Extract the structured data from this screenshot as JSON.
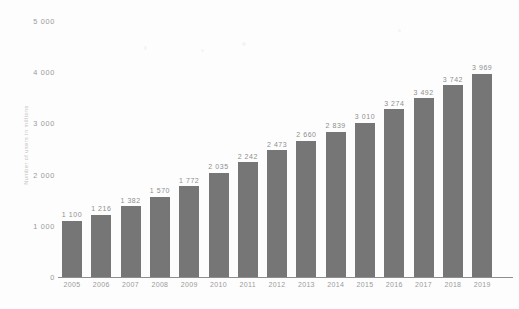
{
  "chart_data": {
    "type": "bar",
    "title": "",
    "subtitle": "",
    "xlabel": "",
    "ylabel": "Number of users in millions",
    "ylim": [
      0,
      5000
    ],
    "grid": false,
    "legend": null,
    "categories": [
      "2005",
      "2006",
      "2007",
      "2008",
      "2009",
      "2010",
      "2011",
      "2012",
      "2013",
      "2014",
      "2015",
      "2016",
      "2017",
      "2018",
      "2019"
    ],
    "values": [
      1100,
      1216,
      1382,
      1570,
      1772,
      2035,
      2242,
      2473,
      2660,
      2839,
      3010,
      3274,
      3492,
      3742,
      3969
    ],
    "value_labels": [
      "1 100",
      "1 216",
      "1 382",
      "1 570",
      "1 772",
      "2 035",
      "2 242",
      "2 473",
      "2 660",
      "2 839",
      "3 010",
      "3 274",
      "3 492",
      "3 742",
      "3 969"
    ],
    "ytick_values": [
      0,
      1000,
      2000,
      3000,
      4000,
      5000
    ],
    "ytick_labels": [
      "0",
      "1 000",
      "2 000",
      "3 000",
      "4 000",
      "5 000"
    ],
    "bar_color": "#767676",
    "background_color": "#ffffff",
    "axis_color": "#8e8e8e",
    "label_color": "#9a9a9a"
  }
}
